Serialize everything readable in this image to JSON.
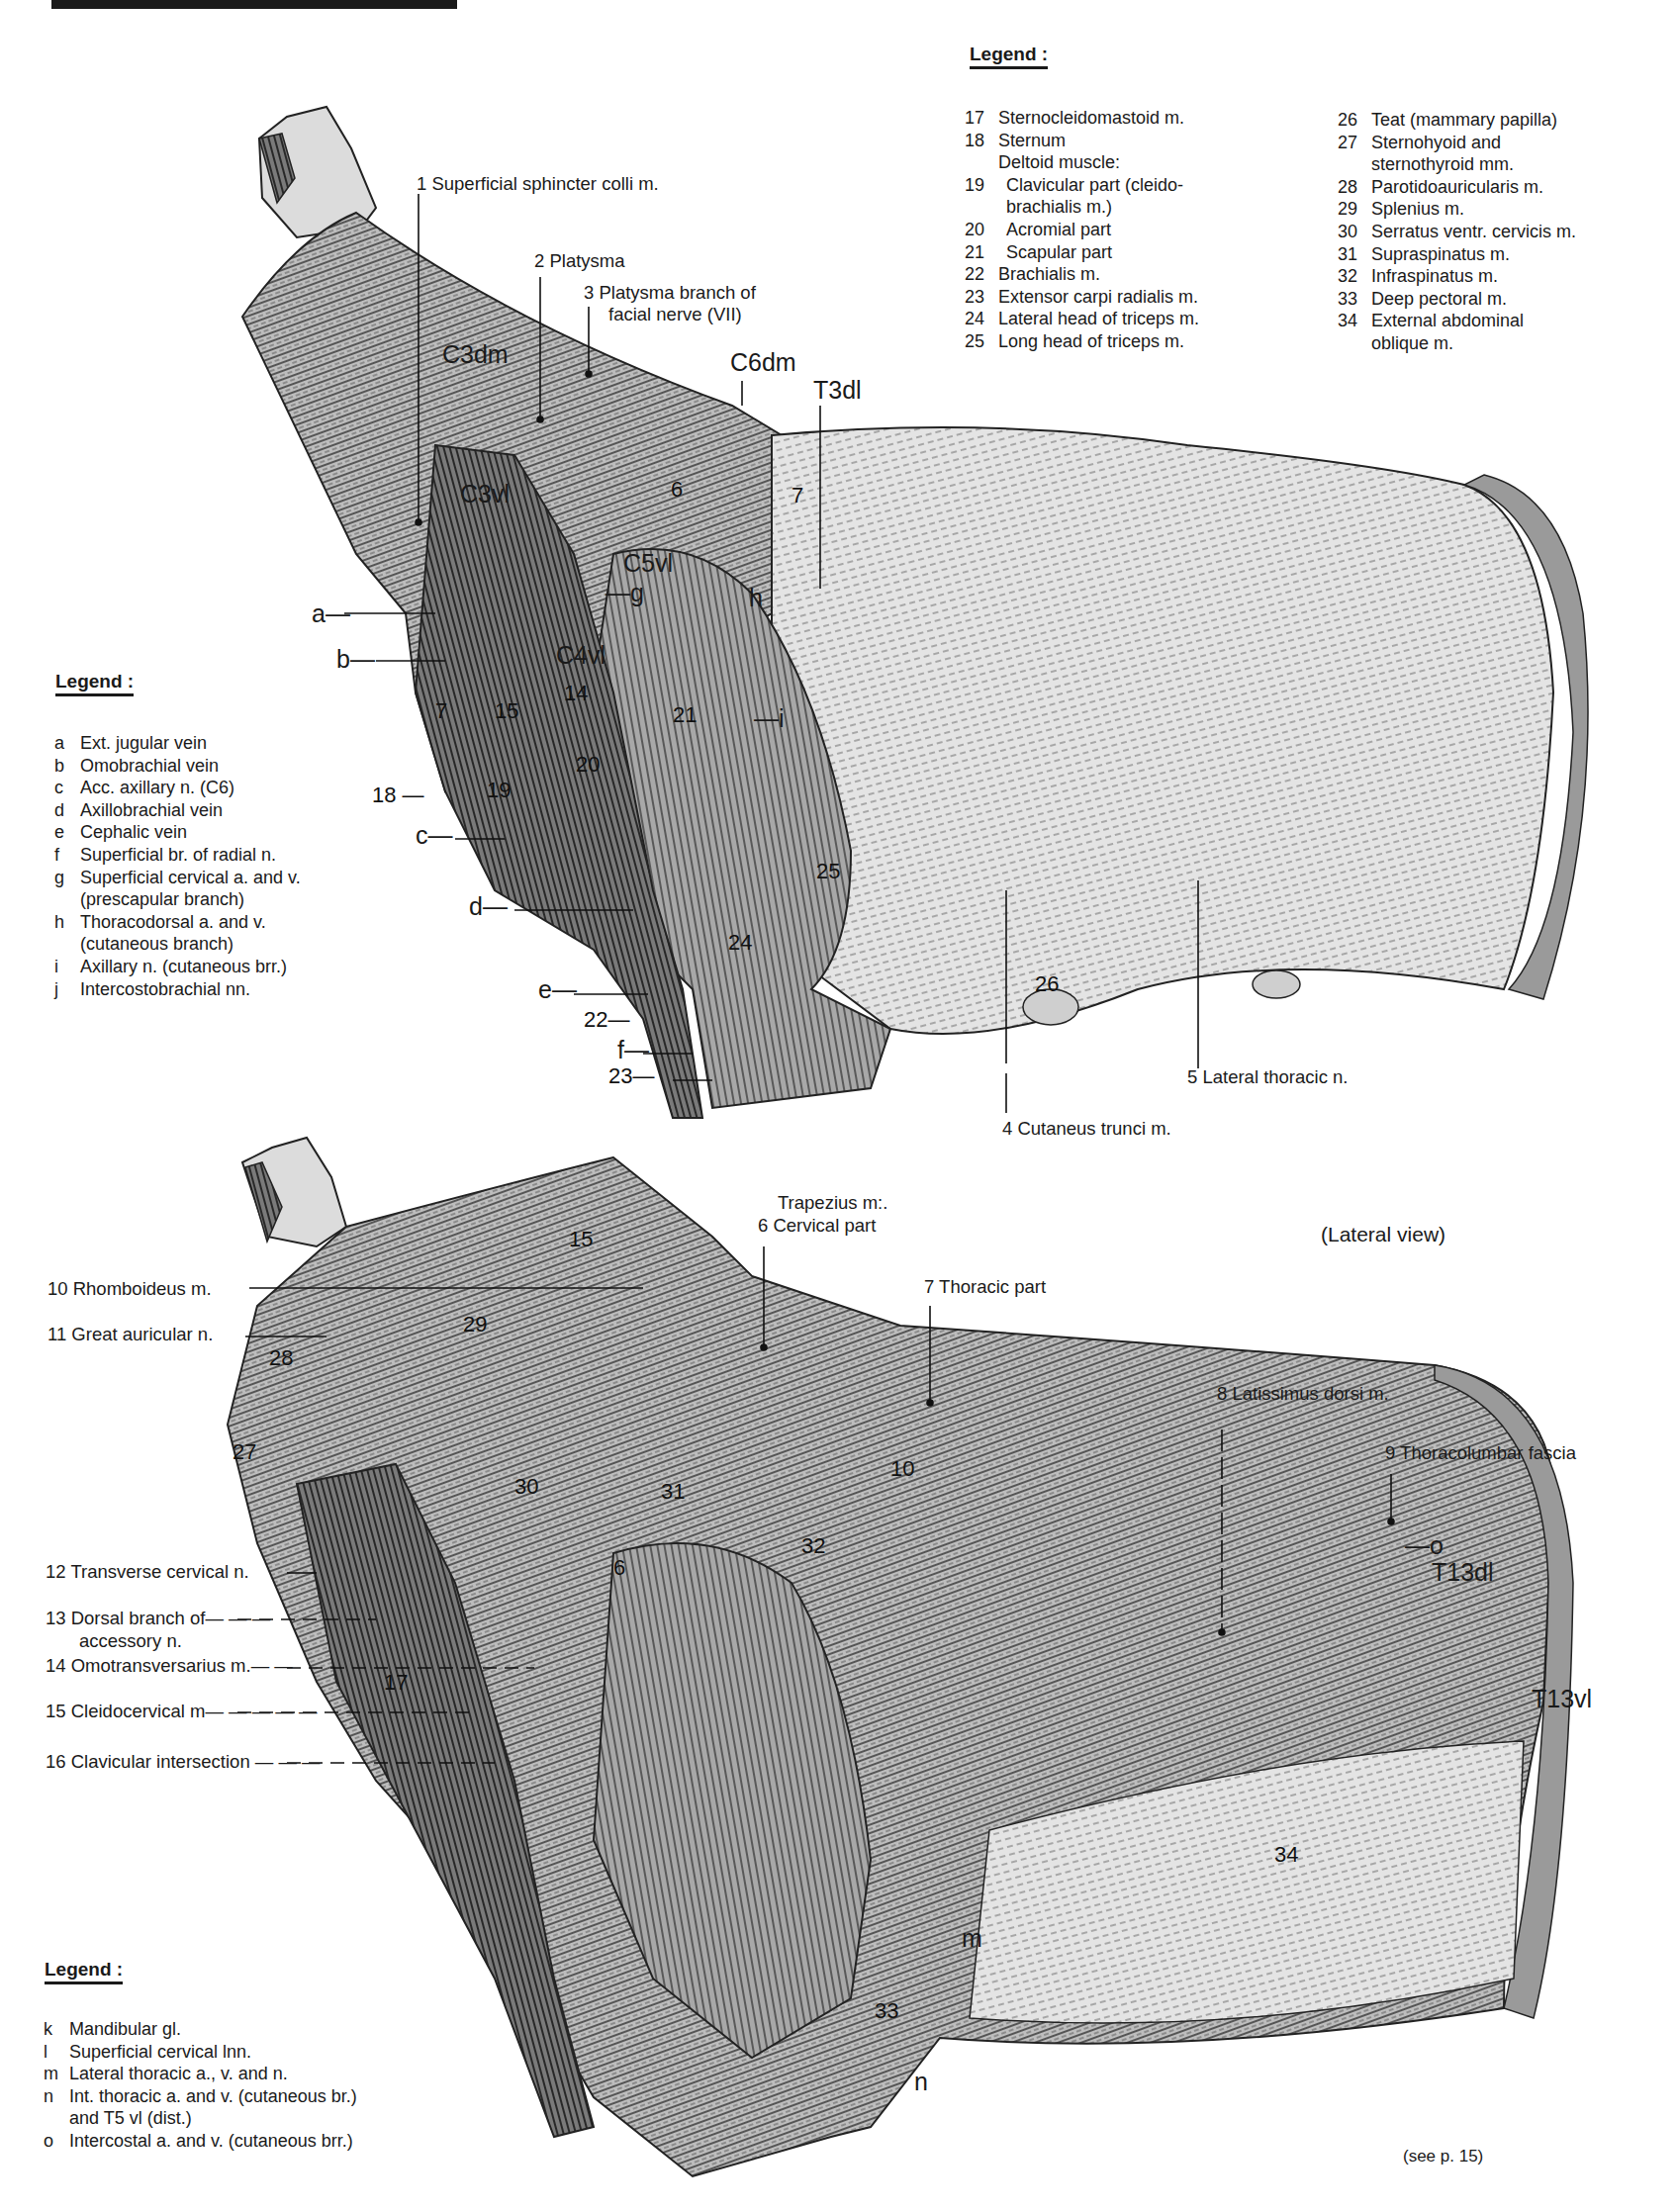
{
  "page": {
    "view_caption": "(Lateral view)",
    "footer_ref": "(see p. 15)"
  },
  "legend_top_right": {
    "heading": "Legend :",
    "col1": [
      {
        "key": "17",
        "text": "Sternocleidomastoid m."
      },
      {
        "key": "18",
        "text": "Sternum"
      },
      {
        "key": "",
        "text": "Deltoid muscle:"
      },
      {
        "key": "19",
        "text": "Clavicular part (cleido-"
      },
      {
        "key": "",
        "text": "brachialis m.)"
      },
      {
        "key": "20",
        "text": "Acromial part"
      },
      {
        "key": "21",
        "text": "Scapular part"
      },
      {
        "key": "22",
        "text": "Brachialis m."
      },
      {
        "key": "23",
        "text": "Extensor carpi radialis m."
      },
      {
        "key": "24",
        "text": "Lateral head of triceps m."
      },
      {
        "key": "25",
        "text": "Long head of triceps m."
      }
    ],
    "col2": [
      {
        "key": "26",
        "text": "Teat (mammary papilla)"
      },
      {
        "key": "27",
        "text": "Sternohyoid and"
      },
      {
        "key": "",
        "text": "sternothyroid mm."
      },
      {
        "key": "28",
        "text": "Parotidoauricularis m."
      },
      {
        "key": "29",
        "text": "Splenius m."
      },
      {
        "key": "30",
        "text": "Serratus ventr. cervicis m."
      },
      {
        "key": "31",
        "text": "Supraspinatus m."
      },
      {
        "key": "32",
        "text": "Infraspinatus m."
      },
      {
        "key": "33",
        "text": "Deep pectoral m."
      },
      {
        "key": "34",
        "text": "External abdominal"
      },
      {
        "key": "",
        "text": "oblique m."
      }
    ]
  },
  "legend_mid_left": {
    "heading": "Legend :",
    "items": [
      {
        "key": "a",
        "text": "Ext. jugular vein"
      },
      {
        "key": "b",
        "text": "Omobrachial vein"
      },
      {
        "key": "c",
        "text": "Acc. axillary n. (C6)"
      },
      {
        "key": "d",
        "text": "Axillobrachial vein"
      },
      {
        "key": "e",
        "text": "Cephalic vein"
      },
      {
        "key": "f",
        "text": "Superficial br. of radial n."
      },
      {
        "key": "g",
        "text": "Superficial cervical a. and v."
      },
      {
        "key": "",
        "text": "(prescapular branch)"
      },
      {
        "key": "h",
        "text": "Thoracodorsal a. and v."
      },
      {
        "key": "",
        "text": "(cutaneous branch)"
      },
      {
        "key": "i",
        "text": "Axillary n. (cutaneous brr.)"
      },
      {
        "key": "j",
        "text": "Intercostobrachial nn."
      }
    ]
  },
  "legend_bottom_left": {
    "heading": "Legend :",
    "items": [
      {
        "key": "k",
        "text": "Mandibular gl."
      },
      {
        "key": "l",
        "text": "Superficial cervical lnn."
      },
      {
        "key": "m",
        "text": "Lateral thoracic a., v. and n."
      },
      {
        "key": "n",
        "text": "Int. thoracic a. and v. (cutaneous br.)"
      },
      {
        "key": "",
        "text": "and T5 vl (dist.)"
      },
      {
        "key": "o",
        "text": "Intercostal a. and v. (cutaneous brr.)"
      }
    ]
  },
  "top_figure_labels": {
    "l1": "1  Superficial sphincter colli m.",
    "l2": "2  Platysma",
    "l3a": "3  Platysma branch of",
    "l3b": "facial nerve (VII)",
    "l4": "4  Cutaneus trunci m.",
    "l5": "5  Lateral thoracic n.",
    "c3dm": "C3dm",
    "c6dm": "C6dm",
    "t3dl": "T3dl",
    "c3vl": "C3vl",
    "c4vl": "C4vl",
    "c5vl": "C5vl",
    "letters": {
      "a": "a—",
      "b": "b—",
      "c": "c—",
      "d": "d—",
      "e": "e—",
      "f": "f—",
      "g": "—g",
      "h": "h",
      "i": "—i"
    },
    "nums": {
      "n6": "6",
      "n7": "7",
      "n14": "14",
      "n15": "15",
      "n17": "7",
      "n18": "18 —",
      "n19": "19",
      "n20": "20",
      "n21": "21",
      "n22": "22—",
      "n23": "23—",
      "n24": "24",
      "n25": "25",
      "n26": "26"
    }
  },
  "bottom_figure_labels": {
    "trapezius": "Trapezius m:.",
    "l6": "6    Cervical part",
    "l7": "7    Thoracic part",
    "l8": "8  Latissimus dorsi m.",
    "l9": "9  Thoracolumbar fascia",
    "l10": "10  Rhomboideus m.",
    "l11": "11  Great auricular n.",
    "l12": "12  Transverse cervical n.",
    "l13a": "13  Dorsal branch of— — —",
    "l13b": "accessory n.",
    "l14": "14  Omotransversarius m.— —",
    "l15": "15  Cleidocervical m— — — — —",
    "l16": "16  Clavicular intersection — — —",
    "t13dl": "T13dl",
    "t13vl": "T13vl",
    "letters": {
      "m": "m",
      "n": "n",
      "o": "—o"
    },
    "nums": {
      "n15": "15",
      "n29": "29",
      "n28": "28",
      "n27": "27",
      "n30": "30",
      "n31": "31",
      "n32": "32",
      "n6": "6",
      "n10": "10",
      "n17": "17",
      "n33": "33",
      "n34": "34"
    }
  }
}
